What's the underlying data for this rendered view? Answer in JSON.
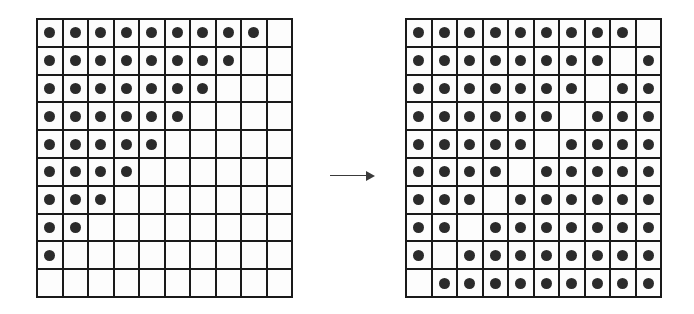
{
  "figure": {
    "type": "grid-transformation-diagram",
    "colors": {
      "background": "#ffffff",
      "grid_line": "#1a1a1a",
      "cell_fill": "#fdfdfd",
      "dot": "#2b2b2b",
      "arrow": "#3a3a3a"
    }
  },
  "arrow": {
    "name": "transformation-arrow",
    "glyph": "→",
    "direction": "right"
  },
  "grids": [
    {
      "id": "left",
      "label": "left-grid",
      "rows": 10,
      "cols": 10,
      "filled_count": 45,
      "rule": "row i (1-indexed) has its first (10 - i) cells filled",
      "matrix": [
        [
          1,
          1,
          1,
          1,
          1,
          1,
          1,
          1,
          1,
          0
        ],
        [
          1,
          1,
          1,
          1,
          1,
          1,
          1,
          1,
          0,
          0
        ],
        [
          1,
          1,
          1,
          1,
          1,
          1,
          1,
          0,
          0,
          0
        ],
        [
          1,
          1,
          1,
          1,
          1,
          1,
          0,
          0,
          0,
          0
        ],
        [
          1,
          1,
          1,
          1,
          1,
          0,
          0,
          0,
          0,
          0
        ],
        [
          1,
          1,
          1,
          1,
          0,
          0,
          0,
          0,
          0,
          0
        ],
        [
          1,
          1,
          1,
          0,
          0,
          0,
          0,
          0,
          0,
          0
        ],
        [
          1,
          1,
          0,
          0,
          0,
          0,
          0,
          0,
          0,
          0
        ],
        [
          1,
          0,
          0,
          0,
          0,
          0,
          0,
          0,
          0,
          0
        ],
        [
          0,
          0,
          0,
          0,
          0,
          0,
          0,
          0,
          0,
          0
        ]
      ]
    },
    {
      "id": "right",
      "label": "right-grid",
      "rows": 10,
      "cols": 10,
      "filled_count": 90,
      "rule": "all cells filled except the anti-diagonal: row i (1-indexed) has column (11 - i) empty",
      "matrix": [
        [
          1,
          1,
          1,
          1,
          1,
          1,
          1,
          1,
          1,
          0
        ],
        [
          1,
          1,
          1,
          1,
          1,
          1,
          1,
          1,
          0,
          1
        ],
        [
          1,
          1,
          1,
          1,
          1,
          1,
          1,
          0,
          1,
          1
        ],
        [
          1,
          1,
          1,
          1,
          1,
          1,
          0,
          1,
          1,
          1
        ],
        [
          1,
          1,
          1,
          1,
          1,
          0,
          1,
          1,
          1,
          1
        ],
        [
          1,
          1,
          1,
          1,
          0,
          1,
          1,
          1,
          1,
          1
        ],
        [
          1,
          1,
          1,
          0,
          1,
          1,
          1,
          1,
          1,
          1
        ],
        [
          1,
          1,
          0,
          1,
          1,
          1,
          1,
          1,
          1,
          1
        ],
        [
          1,
          0,
          1,
          1,
          1,
          1,
          1,
          1,
          1,
          1
        ],
        [
          0,
          1,
          1,
          1,
          1,
          1,
          1,
          1,
          1,
          1
        ]
      ]
    }
  ]
}
